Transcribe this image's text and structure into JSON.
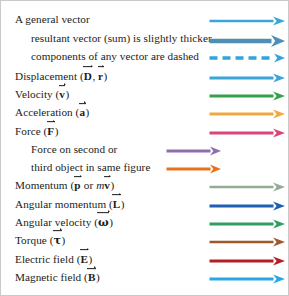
{
  "figure": {
    "name": "vector-notation-legend",
    "border_color": "#c9c9c9",
    "background": "#ffffff"
  },
  "rows": [
    {
      "id": "general-vector",
      "label_prefix": "A general vector",
      "label_suffix": "",
      "symbols": [],
      "indent": 1,
      "y": 19,
      "arrow": {
        "style": "solid",
        "color": "#3aa6d8",
        "thickness": 2.6,
        "x_start": 208,
        "x_end": 283,
        "head_w": 12,
        "head_h": 9
      }
    },
    {
      "id": "resultant-vector",
      "label_prefix": "resultant vector (sum) is slightly thicker",
      "label_suffix": "",
      "symbols": [],
      "indent": 2,
      "y": 41,
      "arrow": {
        "style": "solid",
        "color": "#4d8fb5",
        "thickness": 4.6,
        "x_start": 208,
        "x_end": 283,
        "head_w": 14,
        "head_h": 12
      }
    },
    {
      "id": "components-dashed",
      "label_prefix": "components of any vector are dashed",
      "label_suffix": "",
      "symbols": [],
      "indent": 2,
      "y": 62,
      "arrow": {
        "style": "dashed",
        "color": "#2fa4dd",
        "thickness": 3.4,
        "x_start": 208,
        "x_end": 283,
        "head_w": 11,
        "head_h": 9,
        "dash": "8 5"
      }
    },
    {
      "id": "displacement",
      "label_prefix": "Displacement (",
      "label_suffix": ")",
      "symbols": [
        "D",
        ", ",
        "r"
      ],
      "indent": 1,
      "y": 84,
      "arrow": {
        "style": "solid",
        "color": "#3aa6d8",
        "thickness": 2.8,
        "x_start": 208,
        "x_end": 283,
        "head_w": 12,
        "head_h": 9
      }
    },
    {
      "id": "velocity",
      "label_prefix": "Velocity (",
      "label_suffix": ")",
      "symbols": [
        "v"
      ],
      "indent": 1,
      "y": 105,
      "arrow": {
        "style": "solid",
        "color": "#35a14a",
        "thickness": 2.8,
        "x_start": 208,
        "x_end": 283,
        "head_w": 12,
        "head_h": 9
      }
    },
    {
      "id": "acceleration",
      "label_prefix": "Acceleration (",
      "label_suffix": ")",
      "symbols": [
        "a"
      ],
      "indent": 1,
      "y": 126,
      "arrow": {
        "style": "solid",
        "color": "#efa940",
        "thickness": 2.8,
        "x_start": 208,
        "x_end": 283,
        "head_w": 12,
        "head_h": 9
      }
    },
    {
      "id": "force",
      "label_prefix": "Force (",
      "label_suffix": ")",
      "symbols": [
        "F"
      ],
      "indent": 1,
      "y": 147,
      "arrow": {
        "style": "solid",
        "color": "#d9457c",
        "thickness": 2.8,
        "x_start": 208,
        "x_end": 283,
        "head_w": 12,
        "head_h": 9
      }
    },
    {
      "id": "force-second-object",
      "label_prefix": "Force on second or",
      "label_suffix": "",
      "symbols": [],
      "indent": 2,
      "y": 168,
      "arrow": {
        "style": "solid",
        "color": "#8d6fae",
        "thickness": 2.8,
        "x_start": 165,
        "x_end": 219,
        "head_w": 11,
        "head_h": 9
      }
    },
    {
      "id": "force-third-object",
      "label_prefix": "third object in same figure",
      "label_suffix": "",
      "symbols": [],
      "indent": 2,
      "y": 189,
      "arrow": {
        "style": "solid",
        "color": "#e8711c",
        "thickness": 2.8,
        "x_start": 165,
        "x_end": 219,
        "head_w": 11,
        "head_h": 9
      }
    },
    {
      "id": "momentum",
      "label_prefix": "Momentum (",
      "label_suffix": ")",
      "symbols": [
        "p",
        " or ",
        "m",
        "v"
      ],
      "indent": 1,
      "y": 210,
      "arrow": {
        "style": "solid",
        "color": "#93ab93",
        "thickness": 2.6,
        "x_start": 208,
        "x_end": 283,
        "head_w": 12,
        "head_h": 9
      }
    },
    {
      "id": "angular-momentum",
      "label_prefix": "Angular momentum (",
      "label_suffix": ")",
      "symbols": [
        "L"
      ],
      "indent": 1,
      "y": 231,
      "arrow": {
        "style": "solid",
        "color": "#1f5fb4",
        "thickness": 3.0,
        "x_start": 208,
        "x_end": 283,
        "head_w": 12,
        "head_h": 9
      }
    },
    {
      "id": "angular-velocity",
      "label_prefix": "Angular velocity (",
      "label_suffix": ")",
      "symbols": [
        "ω"
      ],
      "indent": 1,
      "y": 252,
      "arrow": {
        "style": "solid",
        "color": "#2f9e63",
        "thickness": 2.8,
        "x_start": 208,
        "x_end": 283,
        "head_w": 12,
        "head_h": 9
      }
    },
    {
      "id": "torque",
      "label_prefix": "Torque (",
      "label_suffix": ")",
      "symbols": [
        "τ"
      ],
      "indent": 1,
      "y": 273,
      "arrow": {
        "style": "solid",
        "color": "#9c5a2a",
        "thickness": 2.6,
        "x_start": 208,
        "x_end": 283,
        "head_w": 12,
        "head_h": 9
      }
    },
    {
      "id": "electric-field",
      "label_prefix": "Electric field (",
      "label_suffix": ")",
      "symbols": [
        "E"
      ],
      "indent": 1,
      "y": 294,
      "arrow": {
        "style": "solid",
        "color": "#b51f24",
        "thickness": 2.8,
        "x_start": 208,
        "x_end": 283,
        "head_w": 12,
        "head_h": 9
      }
    },
    {
      "id": "magnetic-field",
      "label_prefix": "Magnetic field (",
      "label_suffix": ")",
      "symbols": [
        "B"
      ],
      "indent": 1,
      "y": 315,
      "arrow": {
        "style": "solid",
        "color": "#29a8e0",
        "thickness": 2.8,
        "x_start": 208,
        "x_end": 283,
        "head_w": 12,
        "head_h": 9
      }
    }
  ]
}
